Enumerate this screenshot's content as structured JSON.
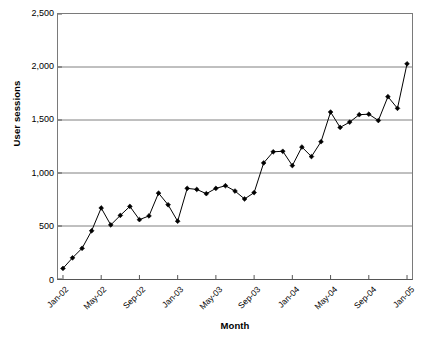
{
  "chart_data": {
    "type": "line",
    "title": "",
    "xlabel": "Month",
    "ylabel": "User sessions",
    "ylim": [
      0,
      2500
    ],
    "ytick_values": [
      0,
      500,
      1000,
      1500,
      2000,
      2500
    ],
    "ytick_labels": [
      "0",
      "500",
      "1,000",
      "1,500",
      "2,000",
      "2,500"
    ],
    "grid": true,
    "legend": false,
    "marker": "filled-diamond",
    "line_color": "#000000",
    "grid_color": "#808080",
    "axis_color": "#555555",
    "xtick_labels": [
      "Jan-02",
      "May-02",
      "Sep-02",
      "Jan-03",
      "May-03",
      "Sep-03",
      "Jan-04",
      "May-04",
      "Sep-04",
      "Jan-05"
    ],
    "xtick_indices": [
      0,
      4,
      8,
      12,
      16,
      20,
      24,
      28,
      32,
      36
    ],
    "x": [
      "Jan-02",
      "Feb-02",
      "Mar-02",
      "Apr-02",
      "May-02",
      "Jun-02",
      "Jul-02",
      "Aug-02",
      "Sep-02",
      "Oct-02",
      "Nov-02",
      "Dec-02",
      "Jan-03",
      "Feb-03",
      "Mar-03",
      "Apr-03",
      "May-03",
      "Jun-03",
      "Jul-03",
      "Aug-03",
      "Sep-03",
      "Oct-03",
      "Nov-03",
      "Dec-03",
      "Jan-04",
      "Feb-04",
      "Mar-04",
      "Apr-04",
      "May-04",
      "Jun-04",
      "Jul-04",
      "Aug-04",
      "Sep-04",
      "Oct-04",
      "Nov-04",
      "Dec-04",
      "Jan-05"
    ],
    "values": [
      100,
      200,
      290,
      455,
      670,
      510,
      600,
      685,
      560,
      595,
      810,
      700,
      545,
      855,
      845,
      805,
      855,
      880,
      830,
      755,
      815,
      1095,
      1200,
      1205,
      1070,
      1245,
      1155,
      1295,
      1575,
      1430,
      1480,
      1550,
      1555,
      1495,
      1720,
      1610,
      2030
    ],
    "series_name": "User sessions"
  }
}
